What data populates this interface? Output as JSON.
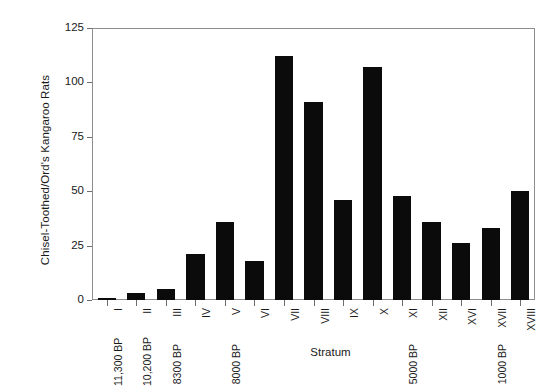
{
  "chart_data": {
    "type": "bar",
    "title": "",
    "xlabel": "Stratum",
    "ylabel": "Chisel-Toothed/Ord's Kangaroo Rats",
    "categories": [
      "I",
      "II",
      "III",
      "IV",
      "V",
      "VI",
      "VII",
      "VIII",
      "IX",
      "X",
      "XI",
      "XII",
      "XVI",
      "XVII",
      "XVIII"
    ],
    "values": [
      1,
      3,
      5,
      21,
      36,
      18,
      112,
      91,
      46,
      107,
      48,
      36,
      26,
      33,
      50
    ],
    "ylim": [
      0,
      125
    ],
    "yticks": [
      0,
      25,
      50,
      75,
      100,
      125
    ],
    "ytick_labels": [
      "0",
      "25",
      "50",
      "75",
      "100",
      "125"
    ],
    "grid": false,
    "legend": "none",
    "bar_color": "#0b0b0b",
    "annotations": [
      {
        "category": "I",
        "text": "11,300 BP"
      },
      {
        "category": "II",
        "text": "10,200 BP"
      },
      {
        "category": "III",
        "text": "8300 BP"
      },
      {
        "category": "V",
        "text": "8000 BP"
      },
      {
        "category": "XI",
        "text": "5000 BP"
      },
      {
        "category": "XVII",
        "text": "1000 BP"
      }
    ]
  }
}
